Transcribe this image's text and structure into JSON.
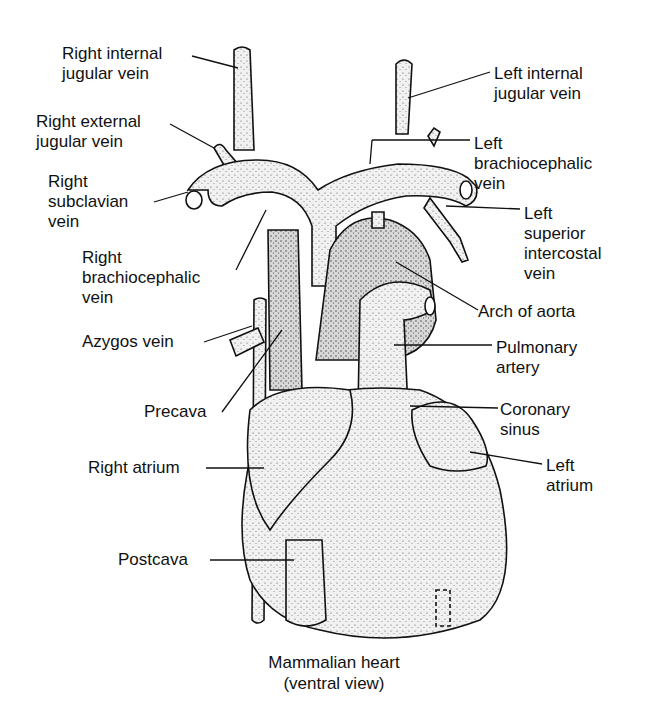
{
  "diagram": {
    "title": "Mammalian heart",
    "subtitle": "(ventral view)",
    "labels": {
      "right_internal_jugular": "Right internal\njugular vein",
      "right_external_jugular": "Right external\njugular vein",
      "right_subclavian": "Right\nsubclavian\nvein",
      "right_brachiocephalic": "Right\nbrachiocephalic\nvein",
      "azygos": "Azygos vein",
      "precava": "Precava",
      "right_atrium": "Right atrium",
      "postcava": "Postcava",
      "left_internal_jugular": "Left internal\njugular vein",
      "left_brachiocephalic": "Left\nbrachiocephalic\nvein",
      "left_superior_intercostal": "Left\nsuperior\nintercostal\nvein",
      "arch_of_aorta": "Arch of aorta",
      "pulmonary_artery": "Pulmonary\nartery",
      "coronary_sinus": "Coronary\nsinus",
      "left_atrium": "Left\natrium"
    },
    "colors": {
      "ink": "#111111",
      "fill": "#e6e6e6",
      "background": "#ffffff"
    }
  }
}
